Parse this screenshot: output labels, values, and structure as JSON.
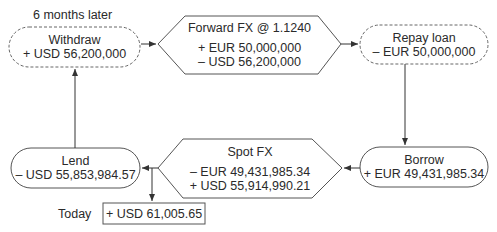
{
  "diagram": {
    "labels": {
      "six_months_later": "6 months later",
      "today": "Today"
    },
    "nodes": {
      "withdraw": {
        "title": "Withdraw",
        "lines": [
          "+ USD 56,200,000"
        ],
        "style": "dashed-rounded"
      },
      "forward_fx": {
        "title": "Forward FX @ 1.1240",
        "lines": [
          "+ EUR 50,000,000",
          "– USD 56,200,000"
        ],
        "style": "hexagon"
      },
      "repay_loan": {
        "title": "Repay loan",
        "lines": [
          "– EUR 50,000,000"
        ],
        "style": "dashed-rounded"
      },
      "borrow": {
        "title": "Borrow",
        "lines": [
          "+ EUR 49,431,985.34"
        ],
        "style": "rounded"
      },
      "spot_fx": {
        "title": "Spot FX",
        "lines": [
          "– EUR 49,431,985.34",
          "+ USD 55,914,990.21"
        ],
        "style": "hexagon"
      },
      "lend": {
        "title": "Lend",
        "lines": [
          "– USD 55,853,984.57"
        ],
        "style": "rounded"
      },
      "result": {
        "lines": [
          "+ USD 61,005.65"
        ],
        "style": "rectangle"
      }
    },
    "edges": [
      {
        "from": "withdraw",
        "to": "forward_fx"
      },
      {
        "from": "forward_fx",
        "to": "repay_loan"
      },
      {
        "from": "repay_loan",
        "to": "borrow"
      },
      {
        "from": "borrow",
        "to": "spot_fx"
      },
      {
        "from": "spot_fx",
        "to": "lend"
      },
      {
        "from": "spot_fx",
        "to": "result"
      },
      {
        "from": "lend",
        "to": "withdraw"
      }
    ],
    "colors": {
      "stroke": "#555555",
      "text": "#2a2a2a",
      "background": "#ffffff"
    }
  }
}
